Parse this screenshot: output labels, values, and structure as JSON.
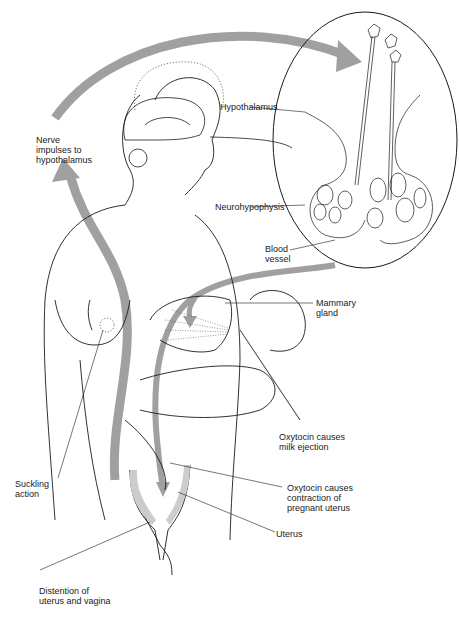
{
  "diagram": {
    "colors": {
      "arrow": "#a0a0a0",
      "line": "#1a1a1a",
      "background": "#ffffff"
    },
    "labels": {
      "nerve_impulses": "Nerve\nimpulses to\nhypothalamus",
      "hypothalamus": "Hypothalamus",
      "neurohypophysis": "Neurohypophysis",
      "blood_vessel": "Blood\nvessel",
      "mammary_gland": "Mammary\ngland",
      "oxytocin_milk": "Oxytocin causes\nmilk ejection",
      "suckling": "Suckling\naction",
      "oxytocin_uterus": "Oxytocin causes\ncontraction of\npregnant uterus",
      "uterus": "Uterus",
      "distention": "Distention of\nuterus and vagina"
    }
  }
}
